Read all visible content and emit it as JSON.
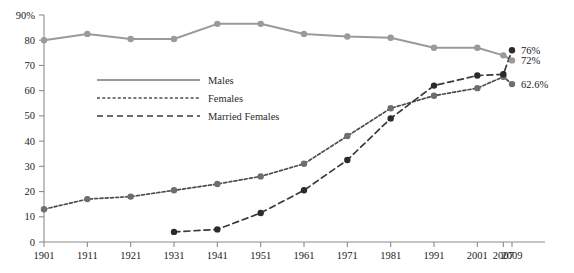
{
  "chart_data": {
    "type": "line",
    "title": "",
    "subtitle": "",
    "xlabel": "",
    "ylabel": "",
    "grid": false,
    "legend_position": "inside-upper-left",
    "x": [
      1901,
      1911,
      1921,
      1931,
      1941,
      1951,
      1961,
      1971,
      1981,
      1991,
      2001,
      2007,
      2009
    ],
    "categories": [
      "1901",
      "1911",
      "1921",
      "1931",
      "1941",
      "1951",
      "1961",
      "1971",
      "1981",
      "1991",
      "2001",
      "2007",
      "2009"
    ],
    "xtick_labels": [
      "1901",
      "1911",
      "1921",
      "1931",
      "1941",
      "1951",
      "1961",
      "1971",
      "1981",
      "1991",
      "2001",
      "2007",
      "2009"
    ],
    "ytick_labels": [
      "0",
      "10",
      "20",
      "30",
      "40",
      "50",
      "60",
      "70",
      "80",
      "90%"
    ],
    "yticks": [
      0,
      10,
      20,
      30,
      40,
      50,
      60,
      70,
      80,
      90
    ],
    "ylim": [
      0,
      90
    ],
    "series": [
      {
        "name": "Males",
        "color": "#9a9a9a",
        "marker_color": "#9a9a9a",
        "style": "solid",
        "values": [
          80,
          82.5,
          80.5,
          80.5,
          86.5,
          86.5,
          82.5,
          81.5,
          81,
          77,
          77,
          74,
          72
        ]
      },
      {
        "name": "Females",
        "color": "#4d4d4d",
        "marker_color": "#6e6e6e",
        "style": "dotted",
        "values": [
          13,
          17,
          18,
          20.5,
          23,
          26,
          31,
          42,
          53,
          58,
          61,
          65.5,
          62.6
        ]
      },
      {
        "name": "Married Females",
        "color": "#3a3a3a",
        "marker_color": "#2b2b2b",
        "style": "dashed",
        "values": [
          null,
          null,
          null,
          4,
          5,
          11.5,
          20.5,
          32.5,
          49,
          62,
          66,
          66.5,
          76
        ]
      }
    ],
    "end_labels": [
      {
        "text": "76%",
        "series": "Married Females",
        "value": 76
      },
      {
        "text": "72%",
        "series": "Males",
        "value": 72
      },
      {
        "text": "62.6%",
        "series": "Females",
        "value": 62.6
      }
    ]
  },
  "legend": {
    "entries": [
      {
        "label": "Males"
      },
      {
        "label": "Females"
      },
      {
        "label": "Married Females"
      }
    ]
  }
}
